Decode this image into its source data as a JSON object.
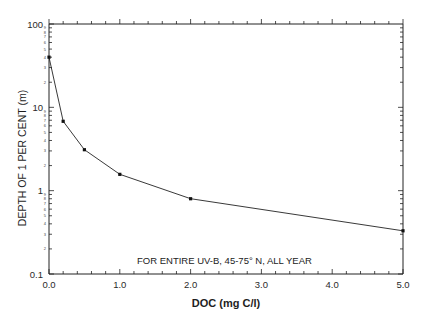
{
  "chart_data": {
    "type": "line",
    "title": "",
    "xlabel": "DOC (mg C/l)",
    "ylabel": "DEPTH OF 1 PER CENT (m)",
    "x": [
      0.0,
      0.2,
      0.5,
      1.0,
      2.0,
      5.0
    ],
    "series": [
      {
        "name": "Depth of 1% UV-B",
        "values": [
          40,
          6.8,
          3.1,
          1.57,
          0.8,
          0.33
        ]
      }
    ],
    "xlim": [
      0.0,
      5.0
    ],
    "ylim": [
      0.1,
      100
    ],
    "yscale": "log",
    "x_ticks": [
      "0.0",
      "1.0",
      "2.0",
      "3.0",
      "4.0",
      "5.0"
    ],
    "y_ticks": [
      "0.1",
      "1",
      "10",
      "100"
    ],
    "annotation": "FOR ENTIRE UV-B, 45-75° N, ALL YEAR",
    "grid": false,
    "legend": "none",
    "markers": "square",
    "color": "#222222"
  }
}
